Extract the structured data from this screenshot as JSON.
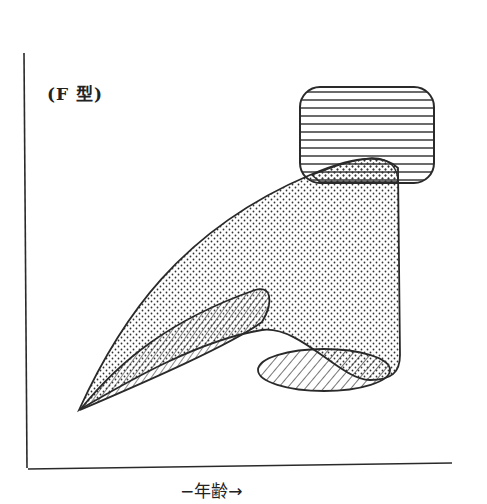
{
  "diagram": {
    "type_label": "(F 型)",
    "x_axis_label": "−年齢→",
    "regions": [
      {
        "id": "horizontal-hatch-region",
        "pattern": "horizontal-lines",
        "position": "top-right"
      },
      {
        "id": "dotted-region",
        "pattern": "dots",
        "position": "center, sweeping from lower-left to upper-right"
      },
      {
        "id": "cross-hatch-region",
        "pattern": "diagonal-lines-over-dots",
        "position": "lower-left inside dotted region"
      },
      {
        "id": "diagonal-hatch-ellipse",
        "pattern": "diagonal-lines",
        "position": "lower-right"
      }
    ],
    "colors": {
      "ink": "#2a2a2a",
      "background": "#ffffff"
    }
  }
}
